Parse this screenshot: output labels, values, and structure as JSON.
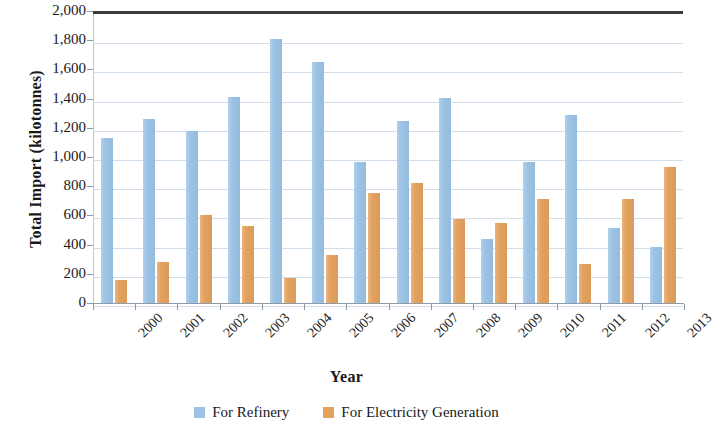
{
  "chart_data": {
    "type": "bar",
    "title": "",
    "xlabel": "Year",
    "ylabel": "Total Import (kilotonnes)",
    "categories": [
      "2000",
      "2001",
      "2002",
      "2003",
      "2004",
      "2005",
      "2006",
      "2007",
      "2008",
      "2009",
      "2010",
      "2011",
      "2012",
      "2013"
    ],
    "series": [
      {
        "name": "For Refinery",
        "color": "#9cc3e5",
        "values": [
          1130,
          1260,
          1180,
          1410,
          1810,
          1650,
          965,
          1250,
          1405,
          440,
          965,
          1285,
          515,
          385
        ]
      },
      {
        "name": "For Electricity Generation",
        "color": "#e3a15e",
        "values": [
          155,
          280,
          605,
          530,
          170,
          330,
          755,
          820,
          575,
          545,
          710,
          265,
          715,
          935
        ]
      }
    ],
    "ylim": [
      0,
      2000
    ],
    "yticks": [
      0,
      200,
      400,
      600,
      800,
      1000,
      1200,
      1400,
      1600,
      1800,
      2000
    ],
    "ytick_labels": [
      "0",
      "200",
      "400",
      "600",
      "800",
      "1,000",
      "1,200",
      "1,400",
      "1,600",
      "1,800",
      "2,000"
    ],
    "grid": true,
    "legend_position": "bottom"
  },
  "axes": {
    "y_title": "Total Import (kilotonnes)",
    "x_title": "Year"
  },
  "legend": {
    "items": [
      {
        "label": "For Refinery",
        "color": "#9cc3e5",
        "swatch": "square-swatch-blue"
      },
      {
        "label": "For Electricity Generation",
        "color": "#e3a15e",
        "swatch": "square-swatch-orange"
      }
    ]
  },
  "colors": {
    "refinery": "#9cc3e5",
    "electricity": "#e3a15e",
    "gridline": "#c9d7e8",
    "axis": "#8d9aa8",
    "plot_top_border": "#3b3b3b",
    "text": "#1a1a1a"
  }
}
